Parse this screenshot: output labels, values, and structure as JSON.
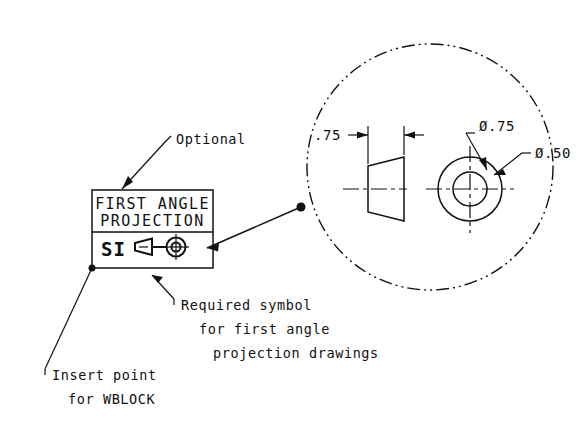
{
  "drawing": {
    "title_block": {
      "line1": "FIRST ANGLE",
      "line2": "PROJECTION",
      "si_label": "SI"
    },
    "annotations": {
      "optional": "Optional",
      "required_symbol_line1": "Required symbol",
      "required_symbol_line2": "for first angle",
      "required_symbol_line3": "projection drawings",
      "insert_point_line1": "Insert point",
      "insert_point_line2": "for WBLOCK"
    },
    "detail": {
      "length_dimension": ".75",
      "outer_diameter": "Ø.75",
      "inner_diameter": "Ø.50"
    },
    "colors": {
      "background": "#ffffff",
      "line": "#111111"
    }
  }
}
